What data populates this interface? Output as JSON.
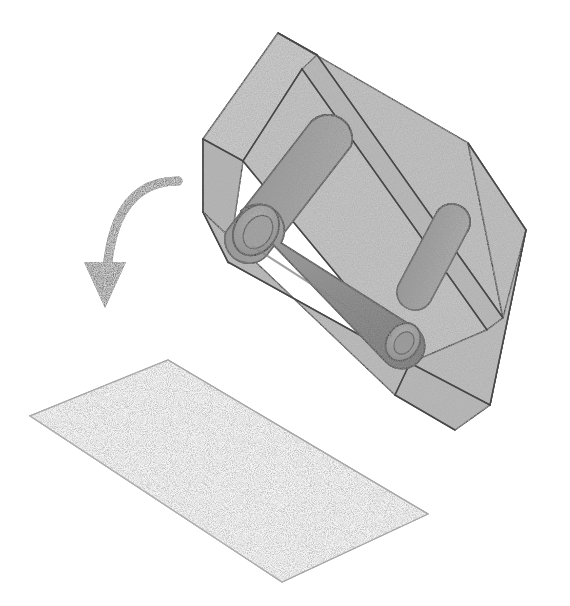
{
  "figure": {
    "kind": "technical-line-illustration",
    "background_color": "#ffffff",
    "canvas": {
      "width": 570,
      "height": 606
    }
  },
  "palette": {
    "paper_white": "#ffffff",
    "outline_stroke": "#4a4a4a",
    "box_face_light": "#c9c9c9",
    "box_face_mid": "#bdbdbd",
    "box_face_dark": "#b2b2b2",
    "box_floor": "#c4c4c4",
    "cylinder_body": "#9a9a9a",
    "cylinder_shade": "#8a8a8a",
    "cylinder_cap": "#a8a8a8",
    "cylinder_edge": "#565656",
    "arrow_gray": "#7b7b7b",
    "sheet_fill": "#f4f4f4",
    "sheet_stroke": "#9e9e9e",
    "noise_speckle": "#6e6e6e"
  },
  "objects": [
    {
      "id": "mold-box",
      "label": "Open rectangular mold box shown in isometric view",
      "role": "container",
      "position": {
        "x": 200,
        "y": 30,
        "width": 330,
        "height": 340
      },
      "fill": "#c3c3c3",
      "stroke": "#4a4a4a",
      "texture": "speckled-stipple",
      "faces": [
        {
          "name": "back-left-wall-outer",
          "shade": "#cacaca"
        },
        {
          "name": "back-right-wall-outer",
          "shade": "#c0c0c0"
        },
        {
          "name": "front-left-wall-inner",
          "shade": "#b6b6b6"
        },
        {
          "name": "interior-floor",
          "shade": "#c4c4c4"
        },
        {
          "name": "front-right-wall-outer",
          "shade": "#bcbcbc"
        }
      ]
    },
    {
      "id": "rod-long-front",
      "label": "Long cylindrical rod with rounded caps lying in the box",
      "role": "cylinder-insert",
      "fill": "#9a9a9a",
      "stroke": "#565656",
      "cap_visible": true
    },
    {
      "id": "rod-upper-left",
      "label": "Second cylindrical rod resting against the back wall",
      "role": "cylinder-insert",
      "fill": "#909090",
      "stroke": "#565656",
      "cap_visible": true
    },
    {
      "id": "rod-right-end",
      "label": "Third cylindrical rod partially visible at the right end of the box",
      "role": "cylinder-insert",
      "fill": "#999999",
      "stroke": "#5e5e5e",
      "cap_visible": false
    },
    {
      "id": "process-arrow",
      "label": "Curved arrow indicating the demolding step",
      "role": "annotation-arrow",
      "color": "#7b7b7b",
      "direction": "down",
      "start": {
        "x": 178,
        "y": 181
      },
      "end": {
        "x": 105,
        "y": 308
      },
      "stroke_width": 9,
      "head_width": 42,
      "head_length": 46
    },
    {
      "id": "released-sheet",
      "label": "Flat rectangular sheet released from the mold",
      "role": "product",
      "fill": "#f4f4f4",
      "stroke": "#a0a0a0",
      "corners": [
        {
          "x": 168,
          "y": 360
        },
        {
          "x": 428,
          "y": 514
        },
        {
          "x": 282,
          "y": 582
        },
        {
          "x": 30,
          "y": 416
        }
      ]
    }
  ],
  "geometry": {
    "box": {
      "top_apex": {
        "x": 278,
        "y": 33
      },
      "top_back_right": {
        "x": 468,
        "y": 143
      },
      "top_left": {
        "x": 203,
        "y": 139
      },
      "top_inner_front": {
        "x": 394,
        "y": 250
      },
      "right_apex": {
        "x": 526,
        "y": 230
      },
      "bottom_front": {
        "x": 410,
        "y": 363
      },
      "bottom_right": {
        "x": 503,
        "y": 318
      },
      "left_bottom": {
        "x": 228,
        "y": 262
      },
      "wall_thickness_px": 14
    },
    "rod_long": {
      "cap_near": {
        "x": 256,
        "y": 229,
        "rx": 20,
        "ry": 26
      },
      "cap_far": {
        "x": 404,
        "y": 341,
        "rx": 15,
        "ry": 18
      },
      "axis_angle_deg": 36
    },
    "rod_upper": {
      "cap": {
        "x": 330,
        "y": 133,
        "rx": 22,
        "ry": 20
      },
      "axis_angle_deg": 218
    },
    "rod_right": {
      "cap": {
        "x": 452,
        "y": 238,
        "rx": 16,
        "ry": 18
      },
      "axis_angle_deg": 214
    }
  },
  "labels": {
    "alt_text": "Schematic of a rectangular mold containing cylindrical rods, with a downward curved arrow pointing to the flat sheet produced after removal.",
    "caption": ""
  },
  "annotations": {
    "text_items": []
  }
}
